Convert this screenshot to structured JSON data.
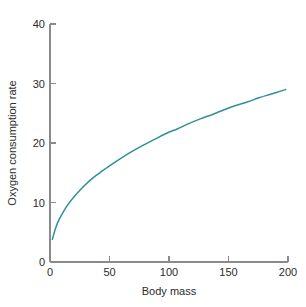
{
  "chart_data": {
    "type": "line",
    "title": "",
    "subtitle": "",
    "xlabel": "Body mass",
    "ylabel": "Oxygen consumption rate",
    "xlim": [
      0,
      205
    ],
    "ylim": [
      0,
      40
    ],
    "xticks": [
      0,
      50,
      100,
      150,
      200
    ],
    "xtick_labels": [
      "0",
      "50",
      "100",
      "150",
      "200"
    ],
    "yticks": [
      0,
      10,
      20,
      30,
      40
    ],
    "ytick_labels": [
      "0",
      "10",
      "20",
      "30",
      "40"
    ],
    "grid": false,
    "legend": null,
    "legend_position": "none",
    "annotations": [],
    "series": [
      {
        "name": "oxygen consumption rate",
        "color": "#2f8f9e",
        "x": [
          2,
          5,
          8,
          12,
          16,
          20,
          25,
          30,
          35,
          40,
          45,
          50,
          60,
          70,
          80,
          90,
          100,
          110,
          120,
          130,
          140,
          150,
          160,
          170,
          180,
          190,
          200,
          203
        ],
        "y": [
          3.8,
          5.8,
          7.2,
          8.6,
          9.8,
          10.8,
          11.9,
          12.9,
          13.8,
          14.6,
          15.3,
          16.0,
          17.3,
          18.5,
          19.6,
          20.6,
          21.6,
          22.4,
          23.3,
          24.1,
          24.8,
          25.6,
          26.3,
          26.9,
          27.6,
          28.2,
          28.8,
          29.0
        ]
      }
    ],
    "plot_pixel_box": {
      "left": 50,
      "right": 288,
      "top": 24,
      "bottom": 262
    },
    "curve_pixel_points": [
      [
        49,
        243
      ],
      [
        52,
        232
      ],
      [
        56,
        222
      ],
      [
        60,
        214
      ],
      [
        65,
        207
      ],
      [
        70,
        201
      ],
      [
        76,
        195
      ],
      [
        82,
        190
      ],
      [
        89,
        184
      ],
      [
        96,
        179
      ],
      [
        105,
        172
      ],
      [
        115,
        166
      ],
      [
        125,
        160
      ],
      [
        136,
        153
      ],
      [
        148,
        146
      ],
      [
        160,
        139
      ],
      [
        172,
        131
      ],
      [
        185,
        123
      ],
      [
        198,
        114
      ],
      [
        212,
        104
      ],
      [
        226,
        94
      ],
      [
        240,
        84
      ],
      [
        255,
        73
      ],
      [
        270,
        61
      ],
      [
        287,
        48
      ]
    ]
  },
  "axes": {
    "x_axis_label": "Body mass",
    "y_axis_label": "Oxygen consumption rate",
    "x_tick_labels": [
      "0",
      "50",
      "100",
      "150",
      "200"
    ],
    "y_tick_labels": [
      "0",
      "10",
      "20",
      "30",
      "40"
    ]
  },
  "style": {
    "curve_color": "#2f8f9e",
    "axis_color": "#8a8a8a",
    "text_color": "#2b2b2b",
    "background": "#ffffff"
  }
}
